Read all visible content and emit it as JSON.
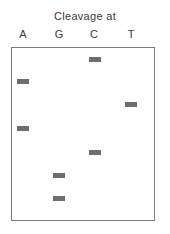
{
  "diagram": {
    "title": "Cleavage at",
    "lanes": [
      {
        "label": "A",
        "center_x": 23
      },
      {
        "label": "G",
        "center_x": 59
      },
      {
        "label": "C",
        "center_x": 94
      },
      {
        "label": "T",
        "center_x": 131
      }
    ],
    "band_color": "#6e6e6e",
    "frame_color": "#7a7a7a",
    "bands": [
      {
        "lane": "C",
        "order_from_top": 1
      },
      {
        "lane": "A",
        "order_from_top": 2
      },
      {
        "lane": "T",
        "order_from_top": 3
      },
      {
        "lane": "A",
        "order_from_top": 4
      },
      {
        "lane": "C",
        "order_from_top": 5
      },
      {
        "lane": "G",
        "order_from_top": 6
      },
      {
        "lane": "G",
        "order_from_top": 7
      }
    ]
  }
}
